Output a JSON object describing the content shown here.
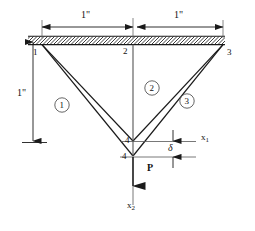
{
  "figure": {
    "type": "truss-structure-diagram",
    "stroke_color": "#1a1a1a",
    "thin_color": "#555555",
    "background": "#ffffff"
  },
  "dimensions": {
    "top_left": "1\"",
    "top_right": "1\"",
    "left_vertical": "1\""
  },
  "nodes": [
    {
      "id": "n1",
      "label": "1",
      "x": 42,
      "y": 46
    },
    {
      "id": "n2",
      "label": "2",
      "x": 133,
      "y": 46
    },
    {
      "id": "n3",
      "label": "3",
      "x": 223,
      "y": 46
    },
    {
      "id": "n4u",
      "label": "4",
      "x": 133,
      "y": 141
    },
    {
      "id": "n4d",
      "label": "4",
      "x": 133,
      "y": 156
    }
  ],
  "elements": [
    {
      "id": "e1",
      "label": "1",
      "from": "n1",
      "to": "n4"
    },
    {
      "id": "e2",
      "label": "2",
      "from": "n2",
      "to": "n4"
    },
    {
      "id": "e3",
      "label": "3",
      "from": "n3",
      "to": "n4"
    }
  ],
  "load": {
    "label": "P",
    "direction": "downward"
  },
  "axes": [
    {
      "name": "x1",
      "base": "x",
      "subscript": "1"
    },
    {
      "name": "x2",
      "base": "x",
      "subscript": "2"
    }
  ],
  "displacement": {
    "symbol": "δ",
    "name": "delta"
  }
}
